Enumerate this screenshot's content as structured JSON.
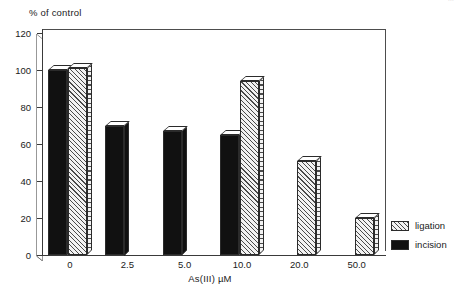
{
  "header": {
    "faint_text": "..."
  },
  "legend": {
    "position": "bottom-right-outside",
    "entries": [
      {
        "label": "ligation",
        "swatch": "hatched",
        "color": "#f2f2f2"
      },
      {
        "label": "incision",
        "swatch": "solid",
        "color": "#111111"
      }
    ]
  },
  "chart_data": {
    "type": "bar",
    "title": "",
    "subtitle": "",
    "xlabel": "As(III) µM",
    "ylabel": "% of control",
    "categories": [
      "0",
      "2.5",
      "5.0",
      "10.0",
      "20.0",
      "50.0"
    ],
    "series": [
      {
        "name": "incision",
        "values": [
          100,
          70,
          67,
          65,
          0,
          0
        ],
        "color": "#111111",
        "fill": "solid"
      },
      {
        "name": "ligation",
        "values": [
          101,
          0,
          0,
          94,
          51,
          20
        ],
        "color": "#f2f2f2",
        "fill": "diagonal-hatch"
      }
    ],
    "ylim": [
      0,
      120
    ],
    "yticks": [
      0,
      20,
      40,
      60,
      80,
      100,
      120
    ],
    "ytick_labels": [
      "0",
      "20",
      "40",
      "60",
      "80",
      "100",
      "120"
    ],
    "xtick_labels": [
      "0",
      "2.5",
      "5.0",
      "10.0",
      "20.0",
      "50.0"
    ],
    "grid": false,
    "legend_position": "right-bottom",
    "style": "3d-extruded-bars"
  }
}
